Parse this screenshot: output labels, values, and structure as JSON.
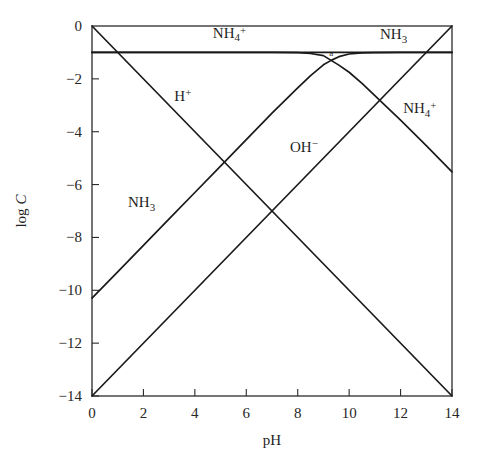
{
  "chart_data": {
    "type": "line",
    "title": "",
    "xlabel": "pH",
    "ylabel": "log C",
    "xlim": [
      0,
      14
    ],
    "ylim": [
      -14,
      0
    ],
    "grid": false,
    "legend_position": "inline-labels",
    "x_ticks": [
      0,
      2,
      4,
      6,
      8,
      10,
      12,
      14
    ],
    "x_tick_labels": [
      "0",
      "2",
      "4",
      "6",
      "8",
      "10",
      "12",
      "14"
    ],
    "y_ticks": [
      0,
      -2,
      -4,
      -6,
      -8,
      -10,
      -12,
      -14
    ],
    "y_tick_labels": [
      "0",
      "−2",
      "−4",
      "−6",
      "−8",
      "−10",
      "−12",
      "−14"
    ],
    "system_point": {
      "pH": 9.3,
      "logC": -1.3,
      "label": "a"
    },
    "total_concentration_logC": -1.0,
    "pKa": 9.3,
    "pKw": 14.0,
    "series": [
      {
        "name": "C_T",
        "label": "",
        "description": "total ammonia horizontal line",
        "x": [
          0,
          14
        ],
        "values": [
          -1.0,
          -1.0
        ]
      },
      {
        "name": "H+",
        "label": "H⁺",
        "x": [
          0,
          14
        ],
        "values": [
          0,
          -14
        ]
      },
      {
        "name": "OH-",
        "label": "OH⁻",
        "x": [
          0,
          14
        ],
        "values": [
          -14,
          0
        ]
      },
      {
        "name": "NH4+",
        "label": "NH₄⁺",
        "x": [
          0,
          1,
          2,
          3,
          4,
          5,
          6,
          7,
          8,
          8.5,
          9,
          9.3,
          9.6,
          10,
          10.5,
          11,
          12,
          13,
          14
        ],
        "values": [
          -1.0,
          -1.0,
          -1.0,
          -1.0,
          -1.0,
          -1.0,
          -1.0,
          -1.0,
          -1.01,
          -1.04,
          -1.12,
          -1.3,
          -1.48,
          -1.75,
          -2.17,
          -2.63,
          -3.56,
          -4.53,
          -5.52
        ]
      },
      {
        "name": "NH3",
        "label": "NH₃",
        "x": [
          0,
          1,
          2,
          3,
          4,
          5,
          6,
          7,
          8,
          8.5,
          9,
          9.3,
          9.6,
          10,
          10.5,
          11,
          12,
          13,
          14
        ],
        "values": [
          -10.3,
          -9.3,
          -8.3,
          -7.3,
          -6.3,
          -5.3,
          -4.3,
          -3.3,
          -2.34,
          -1.88,
          -1.47,
          -1.3,
          -1.16,
          -1.06,
          -1.02,
          -1.01,
          -1.0,
          -1.0,
          -1.0
        ]
      }
    ],
    "curve_labels": [
      {
        "name": "nh4-top-label",
        "base": "NH",
        "sub": "4",
        "sup": "+",
        "x": 4.7,
        "y": -0.45
      },
      {
        "name": "nh3-top-label",
        "base": "NH",
        "sub": "3",
        "sup": "",
        "x": 11.2,
        "y": -0.5
      },
      {
        "name": "h-plus-label",
        "base": "H",
        "sub": "",
        "sup": "+",
        "x": 3.2,
        "y": -2.85
      },
      {
        "name": "nh4-right-label",
        "base": "NH",
        "sub": "4",
        "sup": "+",
        "x": 12.1,
        "y": -3.3
      },
      {
        "name": "oh-minus-label",
        "base": "OH",
        "sub": "",
        "sup": "−",
        "x": 7.7,
        "y": -4.75
      },
      {
        "name": "nh3-left-label",
        "base": "NH",
        "sub": "3",
        "sup": "",
        "x": 1.4,
        "y": -6.85
      }
    ],
    "colors": {
      "curve": "#1a1a1a",
      "frame": "#2b2b2b",
      "text": "#1f1f1f",
      "background": "#ffffff"
    }
  }
}
